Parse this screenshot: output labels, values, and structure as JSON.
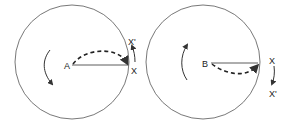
{
  "diagrams": [
    {
      "center_label": "A",
      "edge_label": "X",
      "moved_label": "X'",
      "rotation": "counterclockwise",
      "path_direction": "upward"
    },
    {
      "center_label": "B",
      "edge_label": "X",
      "moved_label": "X'",
      "rotation": "clockwise",
      "path_direction": "downward"
    }
  ],
  "colors": {
    "stroke": "#333333",
    "background": "#ffffff"
  }
}
